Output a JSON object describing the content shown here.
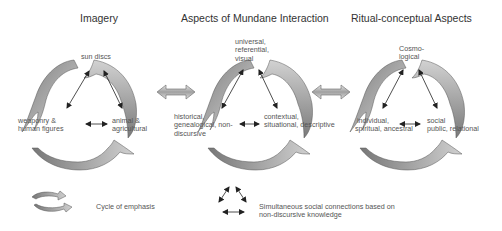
{
  "panels": [
    {
      "title": "Imagery",
      "top": "sun discs",
      "left": [
        "weaponry &",
        "human figures"
      ],
      "right": [
        "animal &",
        "agricultural"
      ]
    },
    {
      "title": "Aspects of Mundane Interaction",
      "top": [
        "universal,",
        "referential,",
        "visual"
      ],
      "left": [
        "historical,",
        "genealogical, non-",
        "discursive"
      ],
      "right": [
        "contextual,",
        "situational, descriptive"
      ]
    },
    {
      "title": "Ritual-conceptual Aspects",
      "top": [
        "Cosmo-",
        "logical"
      ],
      "left": [
        "individual,",
        "spiritual, ancestral"
      ],
      "right": [
        "social",
        "public, relational"
      ]
    }
  ],
  "legend": {
    "cycle_label": "Cycle of emphasis",
    "connections_label": [
      "Simultaneous social connections based on",
      "non-discursive knowledge"
    ]
  },
  "colors": {
    "arrow_dark": "#8a8a8a",
    "arrow_light": "#c8c8c8",
    "line": "#222222"
  }
}
